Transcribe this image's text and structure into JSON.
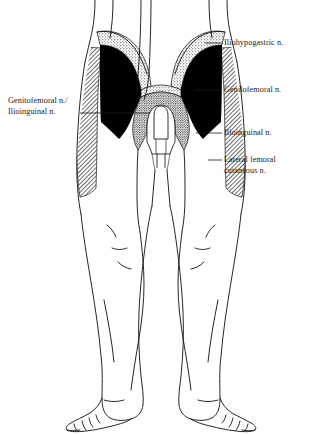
{
  "figure": {
    "orientation": "anterior view, lower torso and legs",
    "background_color": "#ffffff",
    "line_color": "#1a1a1a"
  },
  "labels": {
    "iliohypogastric": "Iliohypogastric n.",
    "genitofemoral_right": "Genilofemoral n.",
    "ilioinguinal_right": "Ilioinguinal n.",
    "lateral_femoral_line1": "Lateral femoral",
    "lateral_femoral_line2": "cutaneous n.",
    "left_line1": "Genitofemoral n./",
    "left_line2": "Ilioinguinal n."
  },
  "regions": [
    {
      "name": "iliohypogastric-territory",
      "label": "Iliohypogastric n.",
      "fill_style": "stipple",
      "fill_color": "#ffffff",
      "stipple_color": "#1a1a1a",
      "description": "dotted band across the upper inguinal / suprapubic area, both sides"
    },
    {
      "name": "genitofemoral-territory",
      "label": "Genilofemoral n.",
      "fill_style": "solid",
      "fill_color": "#000000",
      "description": "solid black triangular wedge in the femoral triangle, both sides"
    },
    {
      "name": "ilioinguinal-territory",
      "label": "Ilioinguinal n.",
      "fill_style": "stipple",
      "fill_color": "#ffffff",
      "stipple_color": "#1a1a1a",
      "description": "dotted region surrounding the external genitalia and medial groin"
    },
    {
      "name": "lateral-femoral-cutaneous-territory",
      "label": "Lateral femoral cutaneous n.",
      "fill_style": "diagonal-hatch",
      "fill_color": "#ffffff",
      "hatch_color": "#1a1a1a",
      "description": "diagonally hatched strip down the lateral aspect of each thigh"
    }
  ],
  "colors": {
    "solid_black": "#000000",
    "ink": "#1a1a1a",
    "paper": "#ffffff"
  }
}
